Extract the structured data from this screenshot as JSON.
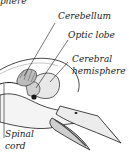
{
  "diagram": {
    "labels": {
      "top_cut": "phere",
      "cerebellum": "Cerebellum",
      "optic_lobe": "Optic lobe",
      "cerebral_line1": "Cerebral",
      "cerebral_line2": "hemisphere",
      "spinal_line1": "Spinal",
      "spinal_line2": "cord"
    },
    "colors": {
      "ink": "#1a1a1a",
      "shade": "#8a8a8a",
      "light": "#d8d8d8",
      "background": "#ffffff"
    }
  }
}
